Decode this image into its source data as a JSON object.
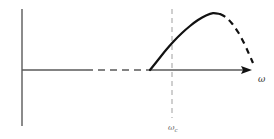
{
  "figure": {
    "title": "",
    "background_color": "#ffffff",
    "width": 274,
    "height": 139
  },
  "axes": {
    "origin": {
      "x": 22,
      "y": 70
    },
    "horizontal_axis": {
      "name": "horizontal-axis",
      "label": "ω",
      "label_position": {
        "x": 258,
        "y": 82
      },
      "color": "#5a5a5a",
      "solid_from_x": 22,
      "solid_to_x": 86,
      "dashed_from_x": 86,
      "dashed_to_x": 152,
      "solid_resume_from_x": 152,
      "arrow_tip_x": 252,
      "has_arrow": true
    },
    "vertical_axis": {
      "name": "vertical-axis",
      "label": "",
      "color": "#5a5a5a",
      "x": 22,
      "top_y": 9,
      "bottom_y": 126,
      "has_arrow": false
    }
  },
  "guide_line": {
    "name": "critical-frequency-guide",
    "label": "ω",
    "label_subscript": "c",
    "label_position": {
      "x": 168,
      "y": 130
    },
    "x": 172,
    "top_y": 9,
    "bottom_y": 118,
    "color": "#b0b0b0",
    "style": "dashed"
  },
  "chart_data": {
    "type": "line",
    "title": "",
    "xlabel": "ω",
    "ylabel": "",
    "grid": false,
    "legend": false,
    "axis_origin_px": {
      "x": 22,
      "y": 70
    },
    "annotations": [
      {
        "name": "critical-frequency-marker",
        "text": "ωc",
        "x_px": 172
      }
    ],
    "series": [
      {
        "name": "response-solid",
        "style": "solid",
        "color": "#111111",
        "width": 2.2,
        "points_px": [
          [
            150,
            70
          ],
          [
            158,
            60
          ],
          [
            166,
            50
          ],
          [
            174,
            41
          ],
          [
            182,
            33
          ],
          [
            190,
            26
          ],
          [
            198,
            20
          ],
          [
            206,
            15.5
          ],
          [
            213,
            13.2
          ],
          [
            220,
            14.0
          ]
        ]
      },
      {
        "name": "response-dashed-tail",
        "style": "dashed",
        "color": "#111111",
        "width": 2.2,
        "points_px": [
          [
            220,
            14.0
          ],
          [
            226,
            17.5
          ],
          [
            232,
            23.5
          ],
          [
            238,
            32
          ],
          [
            244,
            43
          ],
          [
            249,
            54
          ],
          [
            253,
            63
          ]
        ]
      }
    ]
  }
}
